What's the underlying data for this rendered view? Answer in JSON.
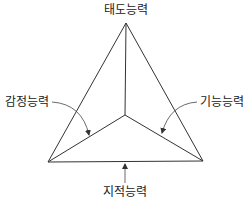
{
  "diagram": {
    "type": "triangular-pyramid-capability-model",
    "labels": {
      "top": "태도능력",
      "left": "감정능력",
      "right": "기능능력",
      "bottom": "지적능력"
    },
    "colors": {
      "line": "#333333",
      "text": "#222222",
      "background": "#ffffff"
    }
  }
}
